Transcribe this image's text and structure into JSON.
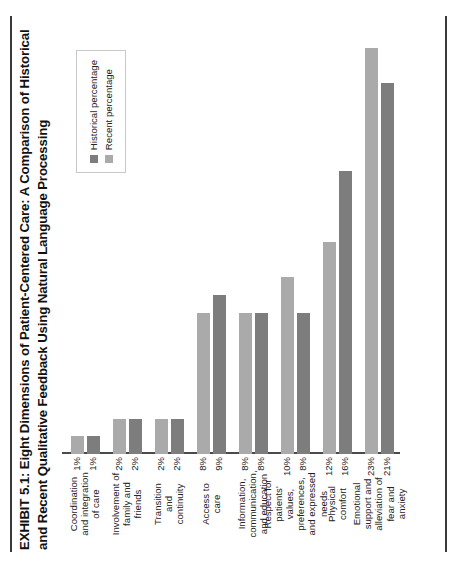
{
  "exhibit": {
    "title": "EXHIBIT 5.1: Eight Dimensions of Patient-Centered Care: A Comparison of Historical and Recent Qualitative Feedback Using Natural Language Processing"
  },
  "legend": {
    "position": "upper-right",
    "items": [
      {
        "label": "Historical percentage",
        "color": "#7d7d7d"
      },
      {
        "label": "Recent percentage",
        "color": "#aaaaaa"
      }
    ]
  },
  "chart_data": {
    "type": "bar",
    "orientation": "horizontal",
    "title": "EXHIBIT 5.1: Eight Dimensions of Patient-Centered Care: A Comparison of Historical and Recent Qualitative Feedback Using Natural Language Processing",
    "xlabel": "",
    "ylabel": "",
    "grid": false,
    "legend_position": "upper-right",
    "xlim": [
      0,
      24
    ],
    "categories": [
      "Emotional support and alleviation of fear and anxiety",
      "Physical comfort",
      "Respect for patients' values, preferences, and expressed needs",
      "Information, communication, and education",
      "Access to care",
      "Transition and continuity",
      "Involvement of family and friends",
      "Coordination and integration of care"
    ],
    "category_lines": [
      [
        "Emotional",
        "support and",
        "alleviation of",
        "fear and",
        "anxiety"
      ],
      [
        "Physical",
        "comfort"
      ],
      [
        "Respect for",
        "patients'",
        "values,",
        "preferences,",
        "and expressed",
        "needs"
      ],
      [
        "Information,",
        "communication,",
        "and education"
      ],
      [
        "Access to",
        "care"
      ],
      [
        "Transition",
        "and",
        "continuity"
      ],
      [
        "Involvement of",
        "family and",
        "friends"
      ],
      [
        "Coordination",
        "and integration",
        "of care"
      ]
    ],
    "series": [
      {
        "name": "Historical percentage",
        "color": "#7d7d7d",
        "values": [
          21,
          16,
          8,
          8,
          9,
          2,
          2,
          1
        ],
        "labels": [
          "21%",
          "16%",
          "8%",
          "8%",
          "9%",
          "2%",
          "2%",
          "1%"
        ]
      },
      {
        "name": "Recent percentage",
        "color": "#aaaaaa",
        "values": [
          23,
          12,
          10,
          8,
          8,
          2,
          2,
          1
        ],
        "labels": [
          "23%",
          "12%",
          "10%",
          "8%",
          "8%",
          "2%",
          "2%",
          "1%"
        ]
      }
    ]
  }
}
